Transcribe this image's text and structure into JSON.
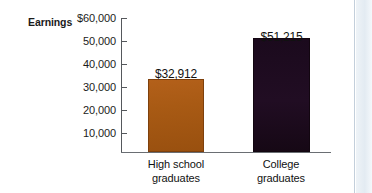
{
  "chart_data": {
    "type": "bar",
    "title": "",
    "subtitle": "",
    "xlabel": "",
    "ylabel": "Earnings",
    "categories": [
      "High school graduates",
      "College graduates"
    ],
    "category_lines": [
      [
        "High school",
        "graduates"
      ],
      [
        "College",
        "graduates"
      ]
    ],
    "values": [
      32912,
      51215
    ],
    "value_labels": [
      "$32,912",
      "$51,215"
    ],
    "ylim": [
      0,
      60000
    ],
    "ytick_values": [
      60000,
      50000,
      40000,
      30000,
      20000,
      10000
    ],
    "ytick_labels": [
      "$60,000",
      "50,000",
      "40,000",
      "30,000",
      "20,000",
      "10,000"
    ],
    "grid": false,
    "legend": null,
    "bar_colors": [
      "#a85a14",
      "#1b0a1d"
    ],
    "axis_color": "#55585c",
    "panel_border_color": "#c3cfdb"
  },
  "axis": {
    "title": "Earnings"
  }
}
